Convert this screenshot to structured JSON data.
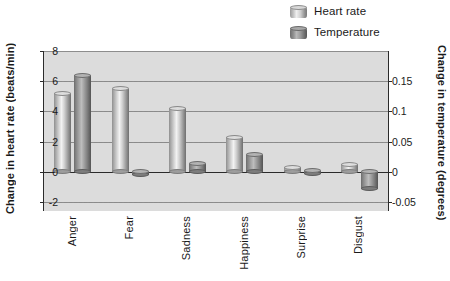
{
  "legend": {
    "position": "top-right",
    "items": [
      {
        "label": "Heart rate",
        "icon": "cylinder-light-icon"
      },
      {
        "label": "Temperature",
        "icon": "cylinder-dark-icon"
      }
    ]
  },
  "axes": {
    "left": {
      "title": "Change in heart rate (beats/min)",
      "ticks": [
        "8",
        "6",
        "4",
        "2",
        "0",
        "-2"
      ],
      "values": [
        8,
        6,
        4,
        2,
        0,
        -2
      ],
      "min": -2.6,
      "max": 8
    },
    "right": {
      "title": "Change in temperature (degrees)",
      "ticks": [
        "0.15",
        "0.1",
        "0.05",
        "0",
        "-0.05"
      ],
      "values": [
        0.15,
        0.1,
        0.05,
        0,
        -0.05
      ],
      "min": -0.065,
      "max": 0.2
    }
  },
  "chart_data": {
    "type": "bar",
    "title": "",
    "xlabel": "",
    "ylabel": "Change in heart rate (beats/min)",
    "y2label": "Change in temperature (degrees)",
    "categories": [
      "Anger",
      "Fear",
      "Sadness",
      "Happiness",
      "Surprise",
      "Disgust"
    ],
    "series": [
      {
        "name": "Heart rate",
        "unit": "beats/min",
        "axis": "left",
        "values": [
          5.2,
          5.5,
          4.2,
          2.3,
          0.3,
          0.5
        ]
      },
      {
        "name": "Temperature",
        "unit": "degrees",
        "axis": "right",
        "values": [
          0.16,
          -0.005,
          0.013,
          0.028,
          0.002,
          -0.028
        ]
      }
    ],
    "ylim": [
      -2.6,
      8
    ],
    "y2lim": [
      -0.065,
      0.2
    ],
    "grid": true,
    "grid_left_style": "solid",
    "grid_right_style": "dashed",
    "legend_position": "top-right",
    "plot_background": "#dcdcdc"
  },
  "colors": {
    "plot_background": "#dcdcdc",
    "page_background": "#ffffff",
    "heart_rate_bar": "#d2d2d2",
    "temperature_bar": "#8f8f8f",
    "axis": "#2b2b2b",
    "gridline_solid": "#8d8d8d",
    "gridline_dashed": "#8a8a8a"
  }
}
